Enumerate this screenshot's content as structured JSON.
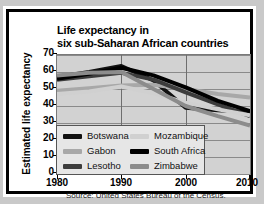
{
  "title_lines": [
    "Life expectancy in",
    "six sub-Saharan African countries"
  ],
  "axis": {
    "ylabel": "Estimated life expectancy",
    "yticks": [
      "0",
      "10",
      "20",
      "30",
      "40",
      "50",
      "60",
      "70"
    ],
    "xticks": [
      "1980",
      "1990",
      "2000",
      "2010"
    ]
  },
  "legend": {
    "items": [
      {
        "label": "Botswana",
        "color": "#111111"
      },
      {
        "label": "Gabon",
        "color": "#a8a8a8"
      },
      {
        "label": "Lesotho",
        "color": "#3c3c3c"
      },
      {
        "label": "Mozambique",
        "color": "#d0d0d0"
      },
      {
        "label": "South Africa",
        "color": "#000000"
      },
      {
        "label": "Zimbabwe",
        "color": "#8c8c8c"
      }
    ]
  },
  "source": "Source: United States Bureau of the Census.",
  "colors": {
    "plot_background": "#d2d2d2",
    "grid": "#8a8a8a",
    "frame": "#000000",
    "page": "#ffffff",
    "outer": "#c9c9c9"
  },
  "chart_data": {
    "type": "line",
    "title": "Life expectancy in six sub-Saharan African countries",
    "xlabel": "",
    "ylabel": "Estimated life expectancy",
    "xlim": [
      1980,
      2010
    ],
    "ylim": [
      0,
      70
    ],
    "ytick_step": 10,
    "grid": true,
    "legend_position": "inside-bottom-left",
    "x": [
      1980,
      1985,
      1990,
      1995,
      2000,
      2005,
      2010
    ],
    "series": [
      {
        "name": "Botswana",
        "color": "#111111",
        "values": [
          57.0,
          60.0,
          63.5,
          55.0,
          39.0,
          37.5,
          36.5
        ]
      },
      {
        "name": "Gabon",
        "color": "#a8a8a8",
        "values": [
          49.0,
          50.5,
          52.0,
          52.5,
          50.0,
          47.0,
          45.0
        ]
      },
      {
        "name": "Lesotho",
        "color": "#3c3c3c",
        "values": [
          55.5,
          57.5,
          59.5,
          55.5,
          48.0,
          41.0,
          34.0
        ]
      },
      {
        "name": "Mozambique",
        "color": "#d0d0d0",
        "values": [
          47.0,
          48.5,
          51.5,
          47.5,
          42.0,
          38.0,
          34.5
        ]
      },
      {
        "name": "South Africa",
        "color": "#000000",
        "values": [
          56.0,
          59.0,
          62.5,
          58.0,
          51.0,
          43.0,
          37.0
        ]
      },
      {
        "name": "Zimbabwe",
        "color": "#8c8c8c",
        "values": [
          58.0,
          59.5,
          60.0,
          50.0,
          40.0,
          34.0,
          28.5
        ]
      }
    ]
  }
}
